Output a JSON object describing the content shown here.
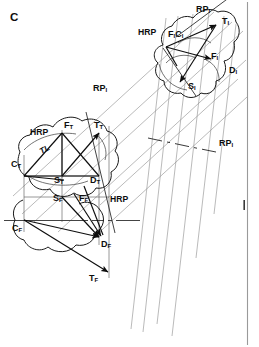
{
  "figure": {
    "panel_label": "C",
    "caption_type": "anatomical-projection-diagram"
  },
  "colors": {
    "ink": "#0d0d0d",
    "outline": "#1a1a1a",
    "projection_line": "#8a8a8a",
    "construction_line": "#4a4a4a",
    "border": "#9a9a9a",
    "background": "#ffffff"
  },
  "labels": {
    "panel": "C",
    "proximal": {
      "rp_top": "RP",
      "rp_top_sub": "I",
      "hrp": "HRP",
      "f1c1_a": "F",
      "f1c1_a_sub": "I",
      "f1c1_b": "C",
      "f1c1_b_sub": "I",
      "t1": "T",
      "t1_sub": "I",
      "f1": "F",
      "f1_sub": "I",
      "s1": "S",
      "s1_sub": "I",
      "d1": "D",
      "d1_sub": "I"
    },
    "middle": {
      "rp_mid": "RP",
      "rp_mid_sub": "I",
      "rp_right": "RP",
      "rp_right_sub": "I"
    },
    "tibia": {
      "hrp": "HRP",
      "tl": "TL",
      "ft": "F",
      "ft_sub": "T",
      "tt": "T",
      "tt_sub": "T",
      "ct": "C",
      "ct_sub": "T",
      "st": "S",
      "st_sub": "T",
      "dt": "D",
      "dt_sub": "T"
    },
    "femur": {
      "hrp": "HRP",
      "sf": "S",
      "sf_sub": "F",
      "ff": "F",
      "ff_sub": "F",
      "cf": "C",
      "cf_sub": "F",
      "df": "D",
      "df_sub": "F",
      "tf": "T",
      "tf_sub": "F"
    }
  }
}
